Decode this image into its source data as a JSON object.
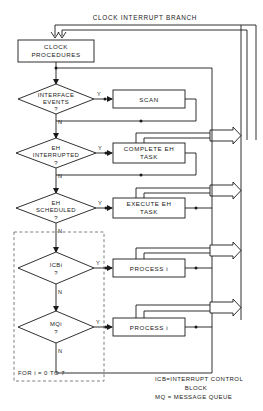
{
  "diagram": {
    "title": "CLOCK INTERRUPT BRANCH",
    "start_box": {
      "label_line1": "CLOCK",
      "label_line2": "PROCEDURES"
    },
    "decisions": [
      {
        "id": "interface-events",
        "line1": "INTERFACE",
        "line2": "EVENTS",
        "line3": "?",
        "yes_label": "Y",
        "no_label": "N"
      },
      {
        "id": "eh-interrupted",
        "line1": "EH",
        "line2": "INTERRUPTED",
        "line3": "?",
        "yes_label": "Y",
        "no_label": "N"
      },
      {
        "id": "eh-scheduled",
        "line1": "EH",
        "line2": "SCHEDULED",
        "line3": "?",
        "yes_label": "Y",
        "no_label": "N"
      },
      {
        "id": "icb-i",
        "line1": "ICBi",
        "line2": "?",
        "line3": "",
        "yes_label": "Y",
        "no_label": "N"
      },
      {
        "id": "mq-i",
        "line1": "MQi",
        "line2": "?",
        "line3": "",
        "yes_label": "Y",
        "no_label": "N"
      }
    ],
    "processes": [
      {
        "id": "scan",
        "line1": "SCAN",
        "line2": ""
      },
      {
        "id": "complete-eh-task",
        "line1": "COMPLETE  EH",
        "line2": "TASK"
      },
      {
        "id": "execute-eh-task",
        "line1": "EXECUTE  EH",
        "line2": "TASK"
      },
      {
        "id": "process-i-icb",
        "line1": "PROCESS i",
        "line2": ""
      },
      {
        "id": "process-i-mq",
        "line1": "PROCESS i",
        "line2": ""
      }
    ],
    "loop_label": "FOR i = 0 TO 7",
    "legend": {
      "line1": "ICB=INTERRUPT CONTROL",
      "line2": "BLOCK",
      "line3": "MQ = MESSAGE QUEUE"
    },
    "colors": {
      "ink": "#1a1a1a",
      "paper": "#ffffff",
      "dashed": "#6f6f6f"
    }
  }
}
